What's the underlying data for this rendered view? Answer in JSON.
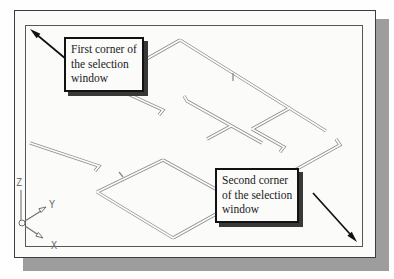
{
  "callouts": {
    "first": {
      "lines": [
        "First corner of",
        "the selection",
        "window"
      ]
    },
    "second": {
      "lines": [
        "Second corner",
        "of the selection",
        "window"
      ]
    }
  },
  "ucs": {
    "z_label": "Z",
    "y_label": "Y",
    "x_label": "X"
  },
  "colors": {
    "canvas-bg": "#fbfbfa",
    "frame-border": "#3c3c3c",
    "inner-border": "#575757",
    "frame-shadow": "#9d9d9d",
    "wall": "#8a8a8a",
    "callout-border": "#121212",
    "callout-shadow": "#383838",
    "arrow": "#111111",
    "ucs": "#6f6f6f",
    "text": "#1a1a1a"
  }
}
